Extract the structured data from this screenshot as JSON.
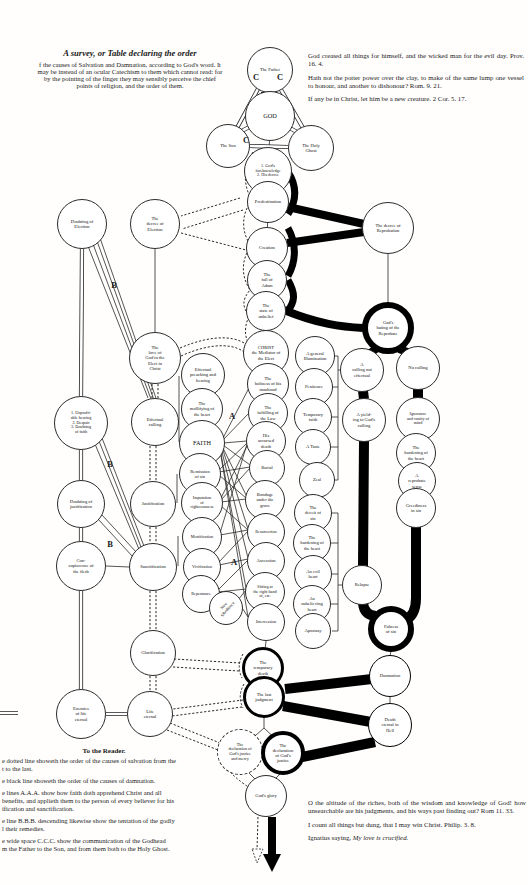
{
  "title": {
    "heading": "A survey, or Table declaring the order",
    "body": "f the causes of Salvation and Damnation, according to God's word. It\nmay be instead of an ocular Catechism to them which cannot read: for\nby the pointing of the finger they may sensibly perceive the chief\npoints of religion, and the order of them."
  },
  "quotes_top": {
    "q1": "God created all things for himself, and the wicked man for the evil day.  Prov. 16. 4.",
    "q2": "Hath not the potter power over the clay, to make of the same lump one vessel to honour, and another to dishonour?  Rom. 9. 21.",
    "q3": "If any be in Christ, let him be a new creature.  2 Cor. 5. 17."
  },
  "reader": {
    "heading": "To the Reader.",
    "p1": "e dotted line showeth the order of the causes of salvation from the\nt to the last.",
    "p2": "e black line showeth the order of the causes of damnation.",
    "p3": "e lines A.A.A. show how faith doth apprehend Christ and all\nbenefits, and applieth them to the person of every believer for his\nification and sanctification.",
    "p4": "e line B.B.B. descending likewise show the tentation of the godly\nl their remedies.",
    "p5": "e wide space C.C.C. show the communication of the Godhead\nm the Father to the Son, and from them both to the Holy Ghost."
  },
  "quotes_bottom": {
    "q1": "O the altitude of the riches, both of the wisdom and knowledge of God! how unsearchable are his judgments, and his ways past finding out?  Rom 11. 33.",
    "q2": "I count all things but dung, that I may win Christ.  Philip. 3. 8.",
    "q3_prefix": "Ignatius saying, ",
    "q3_italic": "My love is crucified."
  },
  "labels": {
    "a": "A",
    "b": "B",
    "c": "C"
  },
  "nodes": {
    "father": "The Father",
    "god": "GOD",
    "son": "The Son",
    "holyghost": "The Holy\nGhost",
    "foreknowledge": "1. God's\nforeknowledge\n2. His decree",
    "predestination": "Predestination",
    "doubting_election": "Doubting of\nElection",
    "decree_election": "The\ndecree of\nElection",
    "creation": "Creation",
    "fall_adam": "The\nfall of\nAdam",
    "state_unbelief": "The\nstate of\nunbelief",
    "decree_reprobation": "The decree of\nReprobation",
    "gods_hating": "God's\nhating of the\nReprobate",
    "love_of_god": "The\nlove of\nGod to the\nElect in\nChrist",
    "christ": "CHRIST\nthe Mediator of\nthe Elect",
    "holiness": "The\nholiness of his\nmanhood",
    "fulfilling": "The\nfulfilling of\nthe Law",
    "accursed": "His\naccursed\ndeath",
    "burial": "Burial",
    "bondage": "Bondage\nunder the\ngrave",
    "resurrection": "Resurrection",
    "ascension": "Ascension",
    "sitting": "Sitting at\nthe right hand\nof, etc.",
    "intercession": "Intercession",
    "unprofitable": "1. Unprofit-\nable hearing\n2. Despair\n3. Doubting\nof faith",
    "effectual_calling": "Effectual\ncalling",
    "effectual_preaching": "Effectual\npreaching and\nhearing",
    "mollifying": "The\nmollifying of\nthe heart",
    "faith": "FAITH",
    "remission": "Remission\nof sin",
    "imputation": "Imputation\nof\nrighteousness",
    "mortification": "Mortification",
    "vivification": "Vivification",
    "repentance": "Repentance",
    "new_obedience": "New\nObedience",
    "doubting_justification": "Doubting of\njustification",
    "justification": "Justification",
    "concupiscence": "Con-\ncupiscence of\nthe flesh",
    "sanctification": "Sanctification",
    "glorification": "Glorification",
    "enemies": "Enemies\nof life\neternal",
    "life_eternal": "Life\neternal",
    "gen_illumination": "A general\nIllumination",
    "penitence": "Penitence",
    "temp_faith": "Temporary\nfaith",
    "a_taste": "A Taste",
    "zeal": "Zeal",
    "deceit": "The\ndeceit of\nsin",
    "hardening1": "The\nhardening of\nthe heart",
    "evil_heart": "An evil\nheart",
    "unbelieving": "An\nunbelieving\nheart",
    "apostasy": "Apostasy",
    "calling_not_eff": "A\ncalling not\neffectual",
    "yielding": "A yield-\ning to God's\ncalling",
    "relapse": "Relapse",
    "no_calling": "No calling",
    "ignorance": "Ignorance\nand vanity of\nmind",
    "hardening2": "The\nhardening of\nthe heart",
    "reprobate_sense": "A\nreprobate\nsense",
    "greediness": "Greediness\nin sin",
    "fulness": "Fulness\nof sin",
    "damnation": "Damnation",
    "death_eternal": "Death\neternal in\nHell",
    "temporary_death": "The\ntemporary\ndeath",
    "last_judgment": "The last\njudgment",
    "decl_mercy": "The\ndeclaration of\nGod's justice\nand mercy",
    "decl_justice": "The\ndeclaration\nof God's\njustice",
    "gods_glory": "God's glory"
  }
}
